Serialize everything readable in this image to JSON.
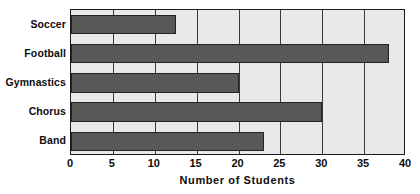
{
  "chart_data": {
    "type": "bar",
    "orientation": "horizontal",
    "title": "",
    "xlabel": "Number of Students",
    "ylabel": "",
    "categories": [
      "Soccer",
      "Football",
      "Gymnastics",
      "Chorus",
      "Band"
    ],
    "values": [
      12.5,
      38,
      20,
      30,
      23
    ],
    "xlim": [
      0,
      40
    ],
    "xticks": [
      0,
      5,
      10,
      15,
      20,
      25,
      30,
      35,
      40
    ],
    "xtick_labels": [
      "0",
      "5",
      "10",
      "15",
      "20",
      "25",
      "30",
      "35",
      "40"
    ],
    "grid": "vertical",
    "legend": "none",
    "colors": {
      "bar_fill": "#585858",
      "bar_border": "#232323",
      "plot_background": "#e9e9e9",
      "axis_border": "#1a1a1a",
      "gridline": "#3a3a3a",
      "text": "#0d0d0d",
      "page_background": "#ffffff"
    }
  }
}
